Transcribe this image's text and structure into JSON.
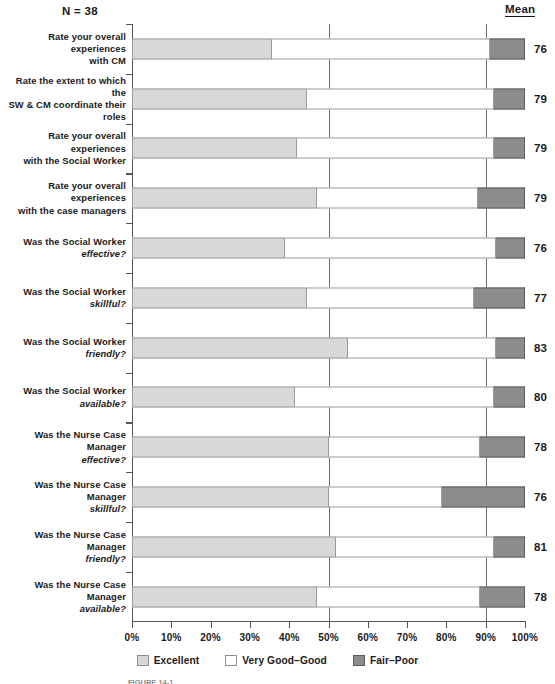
{
  "header": {
    "sample_size_label": "N = 38",
    "mean_column_header": "Mean"
  },
  "legend": {
    "items": [
      {
        "label": "Excellent",
        "color": "#d8d8d8",
        "swatch": "excellent-swatch"
      },
      {
        "label": "Very Good–Good",
        "color": "#ffffff",
        "swatch": "very-good-good-swatch"
      },
      {
        "label": "Fair–Poor",
        "color": "#8c8c8c",
        "swatch": "fair-poor-swatch"
      }
    ]
  },
  "axis": {
    "tick_labels": [
      "0%",
      "10%",
      "20%",
      "30%",
      "40%",
      "50%",
      "60%",
      "70%",
      "80%",
      "90%",
      "100%"
    ],
    "tick_values": [
      0,
      10,
      20,
      30,
      40,
      50,
      60,
      70,
      80,
      90,
      100
    ],
    "reference_lines": [
      50,
      90
    ]
  },
  "caption": {
    "text": "FIGURE 14-1"
  },
  "chart_data": {
    "type": "bar",
    "orientation": "horizontal",
    "stacked": true,
    "stack_unit": "percent",
    "title": "",
    "subtitle": "",
    "xlabel": "",
    "ylabel": "",
    "xlim": [
      0,
      100
    ],
    "grid": false,
    "legend_position": "bottom",
    "annotations": [
      "N = 38",
      "Mean"
    ],
    "categories": [
      "Rate your overall experiences with CM",
      "Rate the extent to which the SW & CM coordinate their roles",
      "Rate your overall experiences with the Social Worker",
      "Rate your overall experiences with the case managers",
      "Was the Social Worker effective?",
      "Was the Social Worker skillful?",
      "Was the Social Worker friendly?",
      "Was the Social Worker available?",
      "Was the Nurse Case Manager effective?",
      "Was the Nurse Case Manager skillful?",
      "Was the Nurse Case Manager friendly?",
      "Was the Nurse Case Manager available?"
    ],
    "series": [
      {
        "name": "Excellent",
        "values": [
          35.5,
          44.5,
          42.0,
          47.0,
          39.0,
          44.5,
          55.0,
          41.5,
          50.0,
          50.0,
          52.0,
          47.0
        ]
      },
      {
        "name": "Very Good–Good",
        "values": [
          55.5,
          47.5,
          50.0,
          41.0,
          53.5,
          42.5,
          37.5,
          50.5,
          38.5,
          29.0,
          40.0,
          41.5
        ]
      },
      {
        "name": "Fair–Poor",
        "values": [
          9.0,
          8.0,
          8.0,
          12.0,
          7.5,
          13.0,
          7.5,
          8.0,
          11.5,
          21.0,
          8.0,
          11.5
        ]
      }
    ],
    "mean_values": [
      76,
      79,
      79,
      79,
      76,
      77,
      83,
      80,
      78,
      76,
      81,
      78
    ]
  },
  "rows": [
    {
      "line1": "Rate your overall experiences",
      "line2": "with CM",
      "line2_italic": false,
      "exc": 35.5,
      "vgg": 55.5,
      "fair": 9.0,
      "mean": "76"
    },
    {
      "line1": "Rate the extent to which the",
      "line2": "SW & CM coordinate their roles",
      "line2_italic": false,
      "exc": 44.5,
      "vgg": 47.5,
      "fair": 8.0,
      "mean": "79"
    },
    {
      "line1": "Rate your overall experiences",
      "line2": "with the Social Worker",
      "line2_italic": false,
      "exc": 42.0,
      "vgg": 50.0,
      "fair": 8.0,
      "mean": "79"
    },
    {
      "line1": "Rate your overall experiences",
      "line2": "with the case managers",
      "line2_italic": false,
      "exc": 47.0,
      "vgg": 41.0,
      "fair": 12.0,
      "mean": "79"
    },
    {
      "line1": "Was the Social Worker",
      "line2": "effective?",
      "line2_italic": true,
      "exc": 39.0,
      "vgg": 53.5,
      "fair": 7.5,
      "mean": "76"
    },
    {
      "line1": "Was the Social Worker",
      "line2": "skillful?",
      "line2_italic": true,
      "exc": 44.5,
      "vgg": 42.5,
      "fair": 13.0,
      "mean": "77"
    },
    {
      "line1": "Was the Social Worker",
      "line2": "friendly?",
      "line2_italic": true,
      "exc": 55.0,
      "vgg": 37.5,
      "fair": 7.5,
      "mean": "83"
    },
    {
      "line1": "Was the Social Worker",
      "line2": "available?",
      "line2_italic": true,
      "exc": 41.5,
      "vgg": 50.5,
      "fair": 8.0,
      "mean": "80"
    },
    {
      "line1": "Was the Nurse Case Manager",
      "line2": "effective?",
      "line2_italic": true,
      "exc": 50.0,
      "vgg": 38.5,
      "fair": 11.5,
      "mean": "78"
    },
    {
      "line1": "Was the Nurse Case Manager",
      "line2": "skillful?",
      "line2_italic": true,
      "exc": 50.0,
      "vgg": 29.0,
      "fair": 21.0,
      "mean": "76"
    },
    {
      "line1": "Was the Nurse Case Manager",
      "line2": "friendly?",
      "line2_italic": true,
      "exc": 52.0,
      "vgg": 40.0,
      "fair": 8.0,
      "mean": "81"
    },
    {
      "line1": "Was the Nurse Case Manager",
      "line2": "available?",
      "line2_italic": true,
      "exc": 47.0,
      "vgg": 41.5,
      "fair": 11.5,
      "mean": "78"
    }
  ]
}
